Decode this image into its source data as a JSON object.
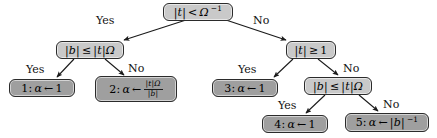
{
  "diagram": {
    "type": "decision-tree",
    "title": "",
    "colors": {
      "decision_node_fill": "#c9c9c9",
      "leaf_node_fill": "#9f9f9f",
      "node_border": "#2b2b2b",
      "edge_stroke": "#1a1a1a",
      "background": "#ffffff",
      "text": "#000000"
    },
    "nodes": {
      "root": {
        "kind": "decision",
        "lhs": "|t|",
        "op": "<",
        "rhs_base": "Ω",
        "rhs_exp": "−1"
      },
      "left_decision": {
        "kind": "decision",
        "lhs": "|b|",
        "op": "≤",
        "rhs": "|t|Ω"
      },
      "right_decision": {
        "kind": "decision",
        "lhs": "|t|",
        "op": "≥",
        "rhs": "1"
      },
      "right_sub_decision": {
        "kind": "decision",
        "lhs": "|b|",
        "op": "≤",
        "rhs": "|t|Ω"
      },
      "leaf1": {
        "kind": "leaf",
        "index": "1:",
        "var": "α",
        "arrow": "←",
        "value": "1"
      },
      "leaf2": {
        "kind": "leaf",
        "index": "2:",
        "var": "α",
        "arrow": "←",
        "value_numerator": "|t|Ω",
        "value_denominator": "|b|"
      },
      "leaf3": {
        "kind": "leaf",
        "index": "3:",
        "var": "α",
        "arrow": "←",
        "value": "1"
      },
      "leaf4": {
        "kind": "leaf",
        "index": "4:",
        "var": "α",
        "arrow": "←",
        "value": "1"
      },
      "leaf5": {
        "kind": "leaf",
        "index": "5:",
        "var": "α",
        "arrow": "←",
        "value_base": "|b|",
        "value_exp": "−1"
      }
    },
    "edge_labels": {
      "root_yes": "Yes",
      "root_no": "No",
      "left_yes": "Yes",
      "left_no": "No",
      "right_yes": "Yes",
      "right_no": "No",
      "right_sub_yes": "Yes",
      "right_sub_no": "No"
    }
  }
}
